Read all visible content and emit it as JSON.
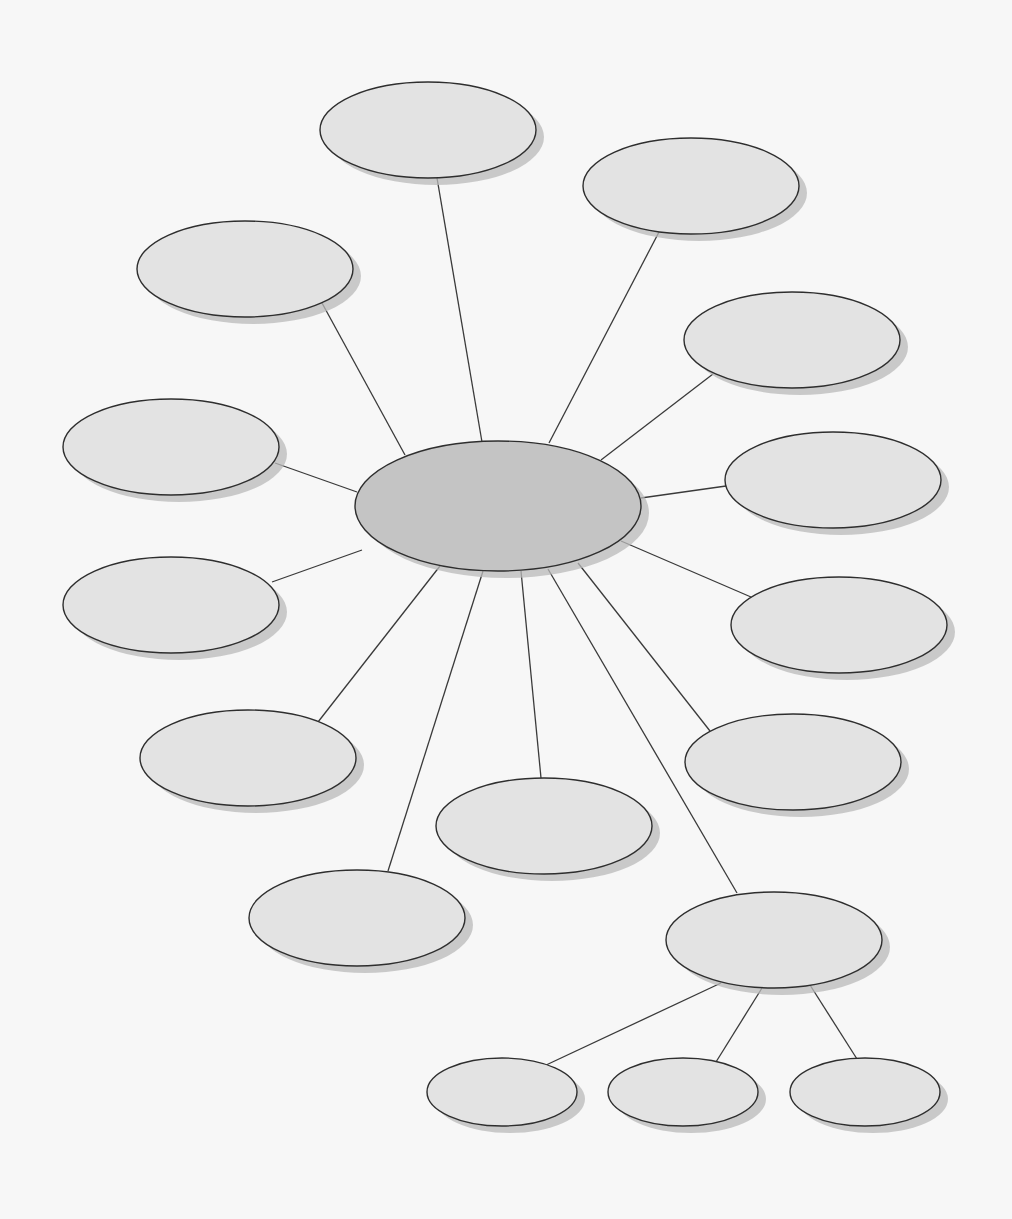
{
  "diagram": {
    "type": "web concept map (blank)",
    "background": "#f7f7f7",
    "colors": {
      "central_fill": "#c4c4c4",
      "node_fill": "#e3e3e3",
      "stroke": "#2e2e2e",
      "shadow": "#b9b9b9"
    },
    "central": {
      "id": "center",
      "cx": 498,
      "cy": 506,
      "rx": 143,
      "ry": 65,
      "label": ""
    },
    "nodes": [
      {
        "id": "n-top",
        "cx": 428,
        "cy": 130,
        "rx": 108,
        "ry": 48,
        "label": ""
      },
      {
        "id": "n-top-right",
        "cx": 691,
        "cy": 186,
        "rx": 108,
        "ry": 48,
        "label": ""
      },
      {
        "id": "n-top-left",
        "cx": 245,
        "cy": 269,
        "rx": 108,
        "ry": 48,
        "label": ""
      },
      {
        "id": "n-right-1",
        "cx": 792,
        "cy": 340,
        "rx": 108,
        "ry": 48,
        "label": ""
      },
      {
        "id": "n-left-1",
        "cx": 171,
        "cy": 447,
        "rx": 108,
        "ry": 48,
        "label": ""
      },
      {
        "id": "n-right-2",
        "cx": 833,
        "cy": 480,
        "rx": 108,
        "ry": 48,
        "label": ""
      },
      {
        "id": "n-left-2",
        "cx": 171,
        "cy": 605,
        "rx": 108,
        "ry": 48,
        "label": ""
      },
      {
        "id": "n-right-3",
        "cx": 839,
        "cy": 625,
        "rx": 108,
        "ry": 48,
        "label": ""
      },
      {
        "id": "n-bottom-left",
        "cx": 248,
        "cy": 758,
        "rx": 108,
        "ry": 48,
        "label": ""
      },
      {
        "id": "n-bottom-right",
        "cx": 793,
        "cy": 762,
        "rx": 108,
        "ry": 48,
        "label": ""
      },
      {
        "id": "n-bottom-mid",
        "cx": 544,
        "cy": 826,
        "rx": 108,
        "ry": 48,
        "label": ""
      },
      {
        "id": "n-bottom-far",
        "cx": 357,
        "cy": 918,
        "rx": 108,
        "ry": 48,
        "label": ""
      },
      {
        "id": "n-hub",
        "cx": 774,
        "cy": 940,
        "rx": 108,
        "ry": 48,
        "label": ""
      },
      {
        "id": "n-sub-1",
        "cx": 502,
        "cy": 1092,
        "rx": 75,
        "ry": 34,
        "label": ""
      },
      {
        "id": "n-sub-2",
        "cx": 683,
        "cy": 1092,
        "rx": 75,
        "ry": 34,
        "label": ""
      },
      {
        "id": "n-sub-3",
        "cx": 865,
        "cy": 1092,
        "rx": 75,
        "ry": 34,
        "label": ""
      }
    ],
    "edges": [
      {
        "from": "center",
        "to": "n-top",
        "x1": 482,
        "y1": 442,
        "x2": 437,
        "y2": 178
      },
      {
        "from": "center",
        "to": "n-top-right",
        "x1": 549,
        "y1": 443,
        "x2": 659,
        "y2": 232
      },
      {
        "from": "center",
        "to": "n-top-left",
        "x1": 405,
        "y1": 455,
        "x2": 322,
        "y2": 303
      },
      {
        "from": "center",
        "to": "n-right-1",
        "x1": 601,
        "y1": 460,
        "x2": 713,
        "y2": 374
      },
      {
        "from": "center",
        "to": "n-left-1",
        "x1": 357,
        "y1": 492,
        "x2": 275,
        "y2": 463
      },
      {
        "from": "center",
        "to": "n-right-2",
        "x1": 641,
        "y1": 498,
        "x2": 726,
        "y2": 486
      },
      {
        "from": "center",
        "to": "n-left-2",
        "x1": 362,
        "y1": 550,
        "x2": 272,
        "y2": 582
      },
      {
        "from": "center",
        "to": "n-right-3",
        "x1": 621,
        "y1": 541,
        "x2": 751,
        "y2": 597
      },
      {
        "from": "center",
        "to": "n-bottom-left",
        "x1": 440,
        "y1": 566,
        "x2": 318,
        "y2": 722
      },
      {
        "from": "center",
        "to": "n-bottom-right",
        "x1": 578,
        "y1": 563,
        "x2": 710,
        "y2": 731
      },
      {
        "from": "center",
        "to": "n-bottom-mid",
        "x1": 521,
        "y1": 571,
        "x2": 541,
        "y2": 778
      },
      {
        "from": "center",
        "to": "n-bottom-far",
        "x1": 483,
        "y1": 571,
        "x2": 388,
        "y2": 871
      },
      {
        "from": "center",
        "to": "n-hub",
        "x1": 548,
        "y1": 569,
        "x2": 737,
        "y2": 893
      },
      {
        "from": "n-hub",
        "to": "n-sub-1",
        "x1": 721,
        "y1": 983,
        "x2": 544,
        "y2": 1066
      },
      {
        "from": "n-hub",
        "to": "n-sub-2",
        "x1": 762,
        "y1": 988,
        "x2": 716,
        "y2": 1062
      },
      {
        "from": "n-hub",
        "to": "n-sub-3",
        "x1": 810,
        "y1": 985,
        "x2": 857,
        "y2": 1059
      }
    ]
  }
}
